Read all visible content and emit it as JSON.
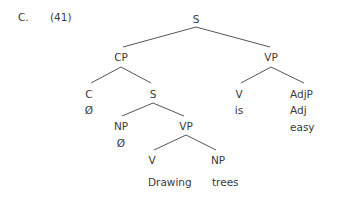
{
  "example": {
    "letter": "C.",
    "number": "(41)"
  },
  "tree": {
    "root": "S",
    "nodes": {
      "s_top": "S",
      "cp": "CP",
      "vp_main": "VP",
      "c": "C",
      "c_null": "Ø",
      "s_embedded": "S",
      "v_main": "V",
      "v_main_word": "is",
      "adjp": "AdjP",
      "adj": "Adj",
      "adj_word": "easy",
      "np_subj": "NP",
      "np_subj_null": "Ø",
      "vp_embedded": "VP",
      "v_embedded": "V",
      "v_embedded_word": "Drawing",
      "np_obj": "NP",
      "np_obj_word": "trees"
    },
    "structure": "[S [CP [C Ø] [S [NP Ø] [VP [V Drawing] [NP trees]]]] [VP [V is] [AdjP [Adj easy]]]]"
  },
  "colors": {
    "text": "#3a3a3a",
    "lines": "#555555",
    "background": "#ffffff"
  }
}
